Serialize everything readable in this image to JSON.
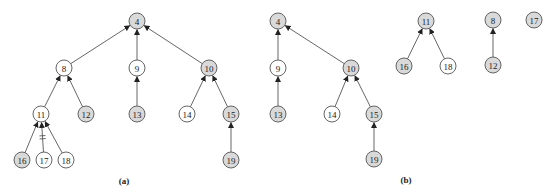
{
  "figure": {
    "colors": {
      "shaded_fill": "#d9d9d9",
      "unshaded_fill": "#ffffff",
      "stroke": "#555555"
    },
    "panels": [
      {
        "id": "a",
        "label": "(a)",
        "label_pos": [
          124,
          184
        ],
        "nodes": [
          {
            "id": "4",
            "label": "4",
            "x": 137,
            "y": 21,
            "shaded": true
          },
          {
            "id": "8",
            "label": "8",
            "x": 64,
            "y": 68,
            "shaded": false
          },
          {
            "id": "9",
            "label": "9",
            "x": 137,
            "y": 68,
            "shaded": false
          },
          {
            "id": "10",
            "label": "10",
            "x": 209,
            "y": 68,
            "shaded": true
          },
          {
            "id": "11",
            "label": "11",
            "x": 41,
            "y": 114,
            "shaded": false
          },
          {
            "id": "12",
            "label": "12",
            "x": 86,
            "y": 114,
            "shaded": true
          },
          {
            "id": "13",
            "label": "13",
            "x": 137,
            "y": 114,
            "shaded": true
          },
          {
            "id": "14",
            "label": "14",
            "x": 187,
            "y": 114,
            "shaded": false
          },
          {
            "id": "15",
            "label": "15",
            "x": 231,
            "y": 114,
            "shaded": true
          },
          {
            "id": "16",
            "label": "16",
            "x": 22,
            "y": 160,
            "shaded": true
          },
          {
            "id": "17",
            "label": "17",
            "x": 44,
            "y": 160,
            "shaded": false
          },
          {
            "id": "18",
            "label": "18",
            "x": 66,
            "y": 160,
            "shaded": false
          },
          {
            "id": "19",
            "label": "19",
            "x": 231,
            "y": 160,
            "shaded": true
          }
        ],
        "edges": [
          {
            "from": "8",
            "to": "4"
          },
          {
            "from": "9",
            "to": "4"
          },
          {
            "from": "10",
            "to": "4"
          },
          {
            "from": "11",
            "to": "8"
          },
          {
            "from": "12",
            "to": "8"
          },
          {
            "from": "13",
            "to": "9"
          },
          {
            "from": "14",
            "to": "10"
          },
          {
            "from": "15",
            "to": "10"
          },
          {
            "from": "16",
            "to": "11"
          },
          {
            "from": "17",
            "to": "11",
            "cut": true
          },
          {
            "from": "18",
            "to": "11"
          },
          {
            "from": "19",
            "to": "15"
          }
        ]
      },
      {
        "id": "b",
        "label": "(b)",
        "label_pos": [
          406,
          183
        ],
        "nodes": [
          {
            "id": "b4",
            "label": "4",
            "x": 278,
            "y": 21,
            "shaded": true
          },
          {
            "id": "b9",
            "label": "9",
            "x": 278,
            "y": 68,
            "shaded": false
          },
          {
            "id": "b10",
            "label": "10",
            "x": 351,
            "y": 68,
            "shaded": true
          },
          {
            "id": "b13",
            "label": "13",
            "x": 278,
            "y": 114,
            "shaded": true
          },
          {
            "id": "b14",
            "label": "14",
            "x": 332,
            "y": 114,
            "shaded": false
          },
          {
            "id": "b15",
            "label": "15",
            "x": 374,
            "y": 114,
            "shaded": true
          },
          {
            "id": "b19",
            "label": "19",
            "x": 374,
            "y": 159,
            "shaded": true
          },
          {
            "id": "b11",
            "label": "11",
            "x": 426,
            "y": 21,
            "shaded": true
          },
          {
            "id": "b16",
            "label": "16",
            "x": 404,
            "y": 66,
            "shaded": true
          },
          {
            "id": "b18",
            "label": "18",
            "x": 448,
            "y": 66,
            "shaded": false
          },
          {
            "id": "b8",
            "label": "8",
            "x": 493,
            "y": 20,
            "shaded": true
          },
          {
            "id": "b12",
            "label": "12",
            "x": 493,
            "y": 65,
            "shaded": true
          },
          {
            "id": "b17",
            "label": "17",
            "x": 534,
            "y": 20,
            "shaded": true
          }
        ],
        "edges": [
          {
            "from": "b9",
            "to": "b4"
          },
          {
            "from": "b10",
            "to": "b4"
          },
          {
            "from": "b13",
            "to": "b9"
          },
          {
            "from": "b14",
            "to": "b10"
          },
          {
            "from": "b15",
            "to": "b10"
          },
          {
            "from": "b19",
            "to": "b15"
          },
          {
            "from": "b16",
            "to": "b11"
          },
          {
            "from": "b18",
            "to": "b11"
          },
          {
            "from": "b12",
            "to": "b8"
          }
        ]
      }
    ],
    "node_radius": 8
  }
}
